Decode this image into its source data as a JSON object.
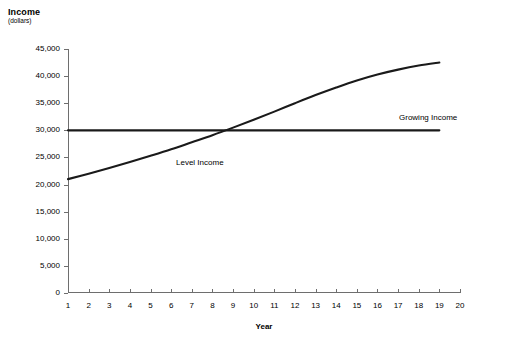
{
  "chart_data": {
    "type": "line",
    "title": "",
    "ylabel": "Income",
    "ylabel_sub": "(dollars)",
    "xlabel": "Year",
    "xlim": [
      1,
      20
    ],
    "ylim": [
      0,
      45000
    ],
    "grid": false,
    "legend_position": "inline-annotations",
    "x": [
      1,
      2,
      3,
      4,
      5,
      6,
      7,
      8,
      9,
      10,
      11,
      12,
      13,
      14,
      15,
      16,
      17,
      18,
      19
    ],
    "y_ticks": [
      0,
      5000,
      10000,
      15000,
      20000,
      25000,
      30000,
      35000,
      40000,
      45000
    ],
    "y_tick_labels": [
      "0",
      "5,000",
      "10,000",
      "15,000",
      "20,000",
      "25,000",
      "30,000",
      "35,000",
      "40,000",
      "45,000"
    ],
    "x_ticks": [
      1,
      2,
      3,
      4,
      5,
      6,
      7,
      8,
      9,
      10,
      11,
      12,
      13,
      14,
      15,
      16,
      17,
      18,
      19,
      20
    ],
    "x_tick_labels": [
      "1",
      "2",
      "3",
      "4",
      "5",
      "6",
      "7",
      "8",
      "9",
      "10",
      "11",
      "12",
      "13",
      "14",
      "15",
      "16",
      "17",
      "18",
      "19",
      "20"
    ],
    "series": [
      {
        "name": "Level Income",
        "label": "Level Income",
        "color": "#1a1a1a",
        "values": [
          30000,
          30000,
          30000,
          30000,
          30000,
          30000,
          30000,
          30000,
          30000,
          30000,
          30000,
          30000,
          30000,
          30000,
          30000,
          30000,
          30000,
          30000,
          30000
        ]
      },
      {
        "name": "Growing Income",
        "label": "Growing Income",
        "color": "#1a1a1a",
        "values": [
          21000,
          22000,
          23050,
          24150,
          25300,
          26500,
          27800,
          29100,
          30500,
          31950,
          33450,
          35000,
          36500,
          37900,
          39200,
          40300,
          41200,
          41950,
          42500
        ]
      }
    ],
    "annotations": [
      {
        "text": "Level Income",
        "x": 5,
        "y": 31500
      },
      {
        "text": "Growing Income",
        "x": 15,
        "y": 39500
      }
    ]
  }
}
